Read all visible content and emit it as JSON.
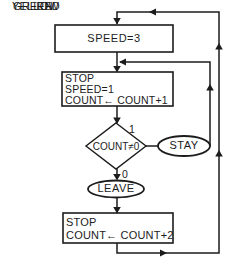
{
  "figure": {
    "type": "flowchart",
    "ink_color": "#1c1c1c",
    "background_color": "#ffffff",
    "states": {
      "green": {
        "label": "GREEN",
        "action": "SPEED=3"
      },
      "yellow": {
        "label": "YELLOW",
        "actions": [
          "STOP",
          "SPEED=1",
          "COUNT← COUNT+1"
        ]
      },
      "red": {
        "label": "RED",
        "actions": [
          "STOP",
          "COUNT← COUNT+2"
        ]
      }
    },
    "decision": {
      "condition": "COUNT≠0",
      "true_branch": "1",
      "false_branch": "0"
    },
    "terminals": {
      "stay": "STAY",
      "leave": "LEAVE"
    }
  }
}
